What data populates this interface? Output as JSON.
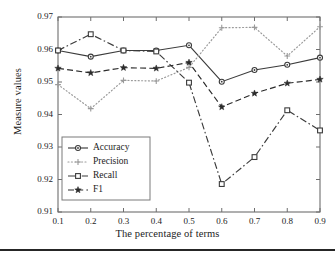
{
  "chart_data": {
    "type": "line",
    "title": "",
    "xlabel": "The percentage of terms",
    "ylabel": "Measure values",
    "x": [
      0.1,
      0.2,
      0.3,
      0.4,
      0.5,
      0.6,
      0.7,
      0.8,
      0.9
    ],
    "xtick_labels": [
      "0.1",
      "0.2",
      "0.3",
      "0.4",
      "0.5",
      "0.6",
      "0.7",
      "0.8",
      "0.9"
    ],
    "ytick_labels": [
      "0.91",
      "0.92",
      "0.93",
      "0.94",
      "0.95",
      "0.96",
      "0.97"
    ],
    "xlim": [
      0.1,
      0.9
    ],
    "ylim": [
      0.91,
      0.97
    ],
    "grid": false,
    "legend_position": "lower-left-inside",
    "series": [
      {
        "name": "Accuracy",
        "marker": "circle",
        "linestyle": "solid",
        "color": "#3b3b3b",
        "values": [
          0.9597,
          0.9578,
          0.9597,
          0.9597,
          0.9613,
          0.9501,
          0.9537,
          0.9553,
          0.9575
        ]
      },
      {
        "name": "Precision",
        "marker": "plus",
        "linestyle": "dotted",
        "color": "#9a9a9a",
        "values": [
          0.9492,
          0.9418,
          0.9505,
          0.9503,
          0.9545,
          0.9667,
          0.9668,
          0.958,
          0.967
        ]
      },
      {
        "name": "Recall",
        "marker": "square",
        "linestyle": "dashdot",
        "color": "#3b3b3b",
        "values": [
          0.9597,
          0.9647,
          0.9597,
          0.9594,
          0.9498,
          0.9186,
          0.9269,
          0.9413,
          0.9351
        ]
      },
      {
        "name": "F1",
        "marker": "star",
        "linestyle": "dashed",
        "color": "#2b2b2b",
        "values": [
          0.9542,
          0.9528,
          0.9544,
          0.9542,
          0.956,
          0.9423,
          0.9465,
          0.9496,
          0.9508
        ]
      }
    ]
  },
  "legend": {
    "entries": [
      {
        "label": "Accuracy"
      },
      {
        "label": "Precision"
      },
      {
        "label": "Recall"
      },
      {
        "label": "F1"
      }
    ]
  }
}
